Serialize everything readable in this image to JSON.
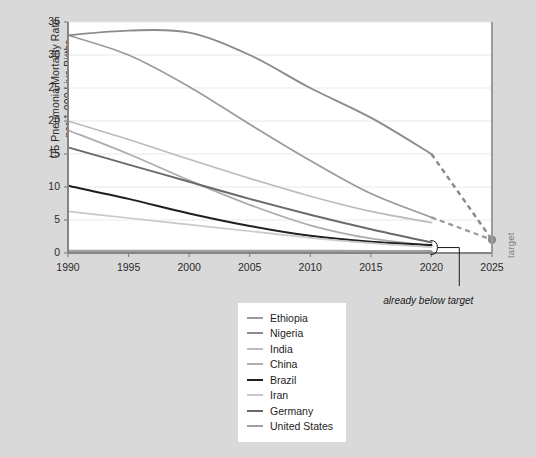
{
  "chart_data": {
    "type": "line",
    "title": "",
    "xlabel": "Year",
    "ylabel": "U5 Pneumonia Mortality Rate per 1,000 Live Births",
    "xlim": [
      1990,
      2025
    ],
    "ylim": [
      0,
      35
    ],
    "xticks": [
      1990,
      1995,
      2000,
      2005,
      2010,
      2015,
      2020,
      2025
    ],
    "yticks": [
      0,
      5,
      10,
      15,
      20,
      25,
      30,
      35
    ],
    "grid": "horizontal",
    "legend_position": "below-center",
    "x": [
      1990,
      1995,
      2000,
      2005,
      2010,
      2015,
      2020
    ],
    "series": [
      {
        "name": "Ethiopia",
        "color": "#9a9a9a",
        "width": 1.7,
        "values": [
          33.0,
          30.0,
          25.2,
          19.5,
          14.0,
          9.0,
          5.4
        ],
        "projection": {
          "x": [
            2020,
            2025
          ],
          "values": [
            5.4,
            2.0
          ],
          "style": "dashed"
        }
      },
      {
        "name": "Nigeria",
        "color": "#8b8b8b",
        "width": 1.9,
        "values": [
          33.0,
          33.7,
          33.4,
          30.0,
          25.0,
          20.5,
          15.0
        ],
        "projection": {
          "x": [
            2020,
            2025
          ],
          "values": [
            15.0,
            2.0
          ],
          "style": "dashed"
        }
      },
      {
        "name": "India",
        "color": "#bcbcbc",
        "width": 1.7,
        "values": [
          20.0,
          17.2,
          14.2,
          11.3,
          8.6,
          6.3,
          4.6
        ],
        "projection": null
      },
      {
        "name": "China",
        "color": "#adadad",
        "width": 1.8,
        "values": [
          18.6,
          15.0,
          11.0,
          7.3,
          4.2,
          2.2,
          1.1
        ],
        "projection": null
      },
      {
        "name": "Brazil",
        "color": "#1f1f1f",
        "width": 2.0,
        "values": [
          10.2,
          8.2,
          6.0,
          4.1,
          2.6,
          1.7,
          1.2
        ],
        "projection": null
      },
      {
        "name": "Iran",
        "color": "#c9c9c9",
        "width": 1.7,
        "values": [
          6.3,
          5.3,
          4.3,
          3.3,
          2.3,
          1.5,
          0.9
        ],
        "projection": null
      },
      {
        "name": "Germany",
        "color": "#6a6a6a",
        "width": 1.9,
        "values": [
          16.0,
          13.4,
          10.8,
          8.2,
          5.8,
          3.6,
          1.6
        ],
        "projection": null
      },
      {
        "name": "United States",
        "color": "#a0a0a0",
        "width": 2.4,
        "values": [
          0.32,
          0.32,
          0.31,
          0.3,
          0.3,
          0.29,
          0.28
        ],
        "projection": null
      }
    ],
    "target_marker": {
      "label": "target",
      "x": 2025,
      "y": 2.0,
      "color": "#8c8c8c"
    },
    "annotations": [
      {
        "text": "already below target",
        "x": 2022.3,
        "bracket_from_year": 2020
      }
    ]
  },
  "legend": {
    "items": [
      {
        "label": "Ethiopia"
      },
      {
        "label": "Nigeria"
      },
      {
        "label": "India"
      },
      {
        "label": "China"
      },
      {
        "label": "Brazil"
      },
      {
        "label": "Iran"
      },
      {
        "label": "Germany"
      },
      {
        "label": "United States"
      }
    ]
  }
}
